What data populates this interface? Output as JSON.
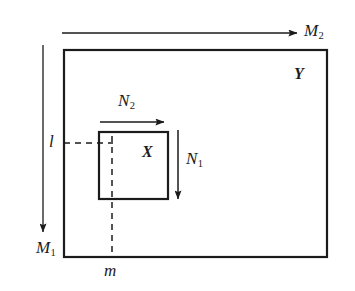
{
  "figure": {
    "type": "commutative-inclusion-diagram",
    "background_color": "#ffffff",
    "stroke_color": "#1b1b1b"
  },
  "shapes": {
    "outer_rectangle": {
      "name": "Y",
      "label": "Y",
      "label_style": "bold-italic",
      "x": 64,
      "y": 50,
      "width": 263,
      "height": 207,
      "stroke_width": 2.2,
      "label_x": 294,
      "label_y": 66
    },
    "inner_rectangle": {
      "name": "X",
      "label": "X",
      "label_style": "bold-italic",
      "x": 99,
      "y": 132,
      "width": 69,
      "height": 67,
      "stroke_width": 2.2,
      "label_x": 142,
      "label_y": 144
    }
  },
  "arrows": [
    {
      "id": "M2",
      "label": "M",
      "subscript": "2",
      "orientation": "horizontal",
      "direction": "right",
      "x1": 62,
      "y1": 33,
      "x2": 297,
      "y2": 33,
      "label_x": 304,
      "label_y": 22
    },
    {
      "id": "M1",
      "label": "M",
      "subscript": "1",
      "orientation": "vertical",
      "direction": "down",
      "x1": 43,
      "y1": 45,
      "x2": 43,
      "y2": 232,
      "label_x": 36,
      "label_y": 239
    },
    {
      "id": "N2",
      "label": "N",
      "subscript": "2",
      "orientation": "horizontal",
      "direction": "right",
      "x1": 100,
      "y1": 122,
      "x2": 164,
      "y2": 122,
      "label_x": 118,
      "label_y": 92
    },
    {
      "id": "N1",
      "label": "N",
      "subscript": "1",
      "orientation": "vertical",
      "direction": "down",
      "x1": 178,
      "y1": 130,
      "x2": 178,
      "y2": 199,
      "label_x": 186,
      "label_y": 150
    }
  ],
  "dashed_lines": [
    {
      "id": "l-guide",
      "orientation": "horizontal",
      "x1": 64,
      "y1": 143,
      "x2": 113,
      "y2": 143
    },
    {
      "id": "m-guide",
      "orientation": "vertical",
      "x1": 112,
      "y1": 136,
      "x2": 112,
      "y2": 257
    }
  ],
  "axis_labels": [
    {
      "id": "l",
      "text": "l",
      "style": "italic",
      "x": 49,
      "y": 133
    },
    {
      "id": "m",
      "text": "m",
      "style": "italic",
      "x": 104,
      "y": 262
    }
  ]
}
